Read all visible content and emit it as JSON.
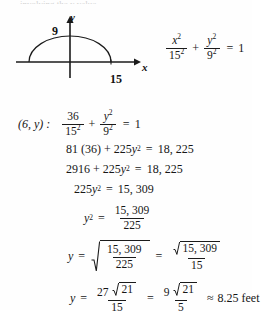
{
  "document": {
    "type": "math-solution",
    "cut_off_top_text": "involving the y value",
    "figure": {
      "name": "semi-ellipse-diagram",
      "x_axis_label": "x",
      "y_axis_label": "y",
      "y_intercept_label": "9",
      "x_intercept_label": "15",
      "curve": "semi-ellipse",
      "semi_major_axis": 15,
      "semi_minor_axis": 9
    },
    "equations": [
      {
        "id": "ellipse-equation",
        "prefix": "",
        "num1": "x",
        "num1_sup": "2",
        "den1": "15",
        "den1_sup": "2",
        "plus": "+",
        "num2": "y",
        "num2_sup": "2",
        "den2": "9",
        "den2_sup": "2",
        "equals": "=",
        "rhs": "1"
      },
      {
        "id": "substitution-equation",
        "prefix": "(6, y) :",
        "num1": "36",
        "den1": "15",
        "den1_sup": "2",
        "plus": "+",
        "num2": "y",
        "num2_sup": "2",
        "den2": "9",
        "den2_sup": "2",
        "equals": "=",
        "rhs": "1"
      },
      {
        "id": "cleared-denominators",
        "lhs_a": "81 (36)",
        "plus": "+",
        "lhs_b_coef": "225",
        "lhs_b_var": "y",
        "lhs_b_sup": "2",
        "equals": "=",
        "rhs": "18, 225"
      },
      {
        "id": "multiplied-out",
        "lhs_a": "2916",
        "plus": "+",
        "lhs_b_coef": "225",
        "lhs_b_var": "y",
        "lhs_b_sup": "2",
        "equals": "=",
        "rhs": "18, 225"
      },
      {
        "id": "isolated-term",
        "lhs_coef": "225",
        "lhs_var": "y",
        "lhs_sup": "2",
        "equals": "=",
        "rhs": "15, 309"
      },
      {
        "id": "divided-form",
        "lhs_var": "y",
        "lhs_sup": "2",
        "equals": "=",
        "num": "15, 309",
        "den": "225"
      },
      {
        "id": "square-root-step",
        "lhs_var": "y",
        "equals": "=",
        "radicand_num": "15, 309",
        "radicand_den": "225",
        "equals2": "=",
        "num2_radicand": "15, 309",
        "den2": "15"
      },
      {
        "id": "simplified-answer",
        "lhs_var": "y",
        "equals": "=",
        "num1_coef": "27",
        "num1_radicand": "21",
        "den1": "15",
        "equals2": "=",
        "num2_coef": "9",
        "num2_radicand": "21",
        "den2": "5",
        "approx": "≈",
        "value": "8.25",
        "unit": "feet"
      }
    ]
  },
  "colors": {
    "ink": "#161616",
    "paper": "#fefefe",
    "rule": "#1b1b1b"
  }
}
